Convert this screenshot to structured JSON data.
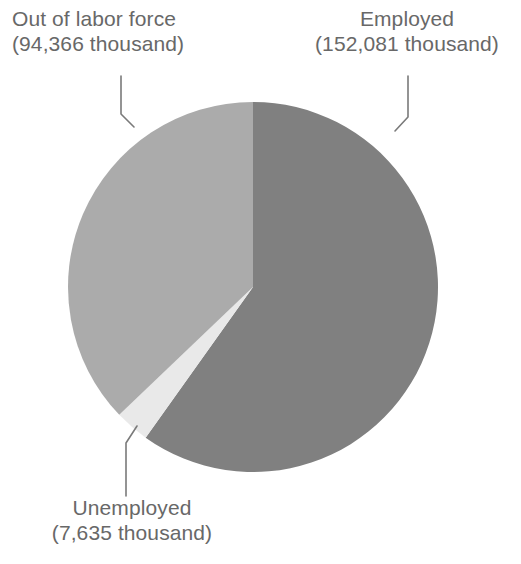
{
  "chart_data": {
    "type": "pie",
    "title": "",
    "subtitle": "",
    "xlabel": "",
    "ylabel": "",
    "units": "thousand",
    "total": 254082,
    "grid": false,
    "legend_position": "none",
    "label_style": "callout-with-leader-line",
    "start_angle_deg": 0,
    "direction": "clockwise",
    "categories": [
      "Employed",
      "Out of labor force",
      "Unemployed"
    ],
    "values": [
      152081,
      94366,
      7635
    ],
    "value_labels": [
      "152,081 thousand",
      "94,366 thousand",
      "7,635 thousand"
    ],
    "percentages": [
      59.9,
      37.1,
      3.0
    ],
    "colors": [
      "#808080",
      "#ababab",
      "#e9e9e9"
    ],
    "slices": [
      {
        "name": "Employed",
        "label_line1": "Employed",
        "label_line2": "(152,081 thousand)",
        "value": 152081,
        "percent": 59.9,
        "color": "#808080",
        "start_deg": 0,
        "end_deg": 215.5
      },
      {
        "name": "Out of labor force",
        "label_line1": "Out of labor force",
        "label_line2": "(94,366 thousand)",
        "value": 94366,
        "percent": 37.1,
        "color": "#ababab",
        "start_deg": 226.3,
        "end_deg": 360
      },
      {
        "name": "Unemployed",
        "label_line1": "Unemployed",
        "label_line2": "(7,635 thousand)",
        "value": 7635,
        "percent": 3.0,
        "color": "#e9e9e9",
        "start_deg": 215.5,
        "end_deg": 226.3
      }
    ]
  },
  "labels": {
    "out_of_labor_force": {
      "line1": "Out of labor force",
      "line2": "(94,366 thousand)"
    },
    "employed": {
      "line1": "Employed",
      "line2": "(152,081 thousand)"
    },
    "unemployed": {
      "line1": "Unemployed",
      "line2": "(7,635 thousand)"
    }
  },
  "style": {
    "background": "#ffffff",
    "text_color": "#686868",
    "leader_line_color": "#7a7a7a"
  }
}
